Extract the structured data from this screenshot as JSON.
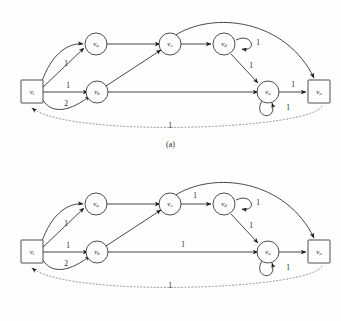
{
  "figure": {
    "type": "directed-flow-network-diagram",
    "panel_count": 2,
    "background_color": "#fefefe",
    "edge_color": "#333333",
    "dotted_edge_color": "#8a8a8a",
    "node_stroke_color": "#3a3a3a",
    "node_fill_color": "#fdfdfd"
  },
  "captions": {
    "a": "(a)",
    "b": "(b)"
  },
  "nodes": {
    "vi": {
      "label": "v",
      "sub": "i",
      "shape": "square"
    },
    "va": {
      "label": "v",
      "sub": "a",
      "shape": "circle"
    },
    "vb": {
      "label": "v",
      "sub": "b",
      "shape": "circle"
    },
    "vc": {
      "label": "v",
      "sub": "c",
      "shape": "circle"
    },
    "vd": {
      "label": "v",
      "sub": "d",
      "shape": "circle"
    },
    "ve": {
      "label": "v",
      "sub": "e",
      "shape": "circle"
    },
    "vo": {
      "label": "v",
      "sub": "o",
      "shape": "square"
    }
  },
  "panel_a": {
    "caption": "(a)",
    "labels": {
      "vi_va_curve": "1",
      "vi_vb_straight": "1",
      "vi_vb_curve": "2",
      "va_vc": "",
      "vb_vc": "",
      "vc_vd": "",
      "vd_loop": "1",
      "vd_ve": "1",
      "vb_ve": "",
      "ve_loop": "1",
      "ve_vo": "1",
      "vc_vo_arc": "",
      "vo_vi_dotted": "1"
    }
  },
  "panel_b": {
    "caption": "(b)",
    "labels": {
      "vi_va_curve": "1",
      "vi_vb_straight": "1",
      "vi_vb_curve": "2",
      "va_vc": "",
      "vb_vc": "",
      "vc_vd": "1",
      "vd_loop": "1",
      "vd_ve": "1",
      "vb_ve": "1",
      "ve_loop": "1",
      "ve_vo": "",
      "vc_vo_arc": "",
      "vo_vi_dotted": "1"
    }
  }
}
